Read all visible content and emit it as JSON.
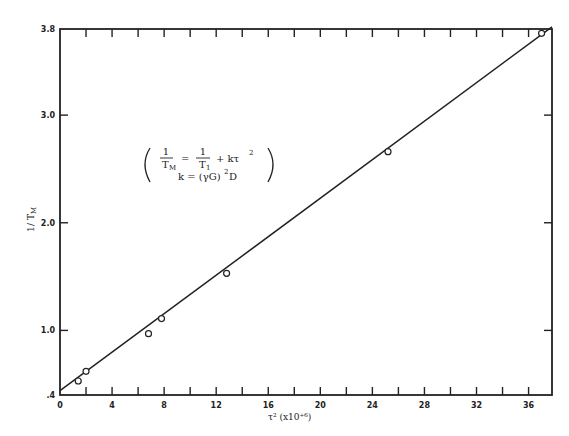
{
  "chart_data": {
    "type": "scatter",
    "title": "",
    "xlabel": "τ² (x10⁺⁶)",
    "ylabel": "1/T_M",
    "xlim": [
      0,
      37.8
    ],
    "ylim": [
      0.4,
      3.8
    ],
    "x_ticks": [
      0,
      4,
      8,
      12,
      16,
      20,
      24,
      28,
      32,
      36
    ],
    "x_tick_labels": [
      "0",
      "4",
      "8",
      "12",
      "16",
      "20",
      "24",
      "28",
      "32",
      "36"
    ],
    "y_ticks": [
      0.4,
      1.0,
      2.0,
      3.0,
      3.8
    ],
    "y_tick_labels": [
      ".4",
      "1.0",
      "2.0",
      "3.0",
      "3.8"
    ],
    "grid": false,
    "legend": null,
    "series": [
      {
        "name": "measured",
        "marker": "open-circle",
        "x": [
          1.4,
          2.0,
          6.8,
          7.8,
          12.8,
          25.2,
          37.0
        ],
        "y": [
          0.53,
          0.62,
          0.97,
          1.11,
          1.53,
          2.66,
          3.76
        ]
      },
      {
        "name": "linear fit",
        "style": "line",
        "x": [
          0,
          37.8
        ],
        "y": [
          0.44,
          3.82
        ]
      }
    ],
    "annotations": [
      {
        "text": "1/T_M = 1/T_1 + kτ²",
        "position": "upper-left"
      },
      {
        "text": "k = (γG)² D",
        "position": "upper-left"
      }
    ]
  },
  "labels": {
    "x_axis_title": "τ² (x10⁺⁶)",
    "y_axis_title_num": "1",
    "y_axis_title_den": "T",
    "y_axis_title_sub": "M",
    "eq_line1_lhs_num": "1",
    "eq_line1_lhs_den": "T",
    "eq_line1_lhs_sub": "M",
    "eq_line1_eq": "=",
    "eq_line1_rhs_num": "1",
    "eq_line1_rhs_den": "T",
    "eq_line1_rhs_sub": "1",
    "eq_line1_plus": "+ kτ",
    "eq_line1_sup": "2",
    "eq_line2": "k = (γG)",
    "eq_line2_sup": "2",
    "eq_line2_tail": " D"
  }
}
